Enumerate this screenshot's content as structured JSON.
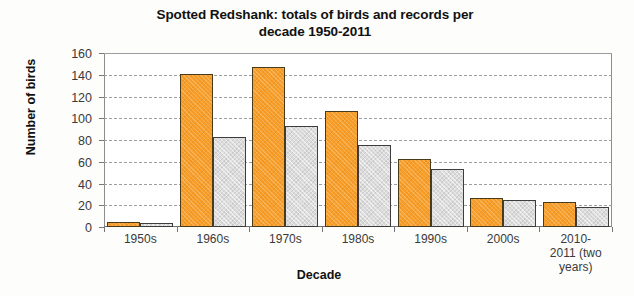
{
  "chart_data": {
    "type": "bar",
    "title": "Spotted Redshank: totals of birds and records per decade 1950-2011",
    "title_line1": "Spotted Redshank: totals of birds and records per",
    "title_line2": "decade 1950-2011",
    "xlabel": "Decade",
    "ylabel": "Number of birds",
    "ylim": [
      0,
      160
    ],
    "ytick_step": 20,
    "yticks": [
      160,
      140,
      120,
      100,
      80,
      60,
      40,
      20,
      0
    ],
    "grid": true,
    "legend": "none",
    "categories": [
      "1950s",
      "1960s",
      "1970s",
      "1980s",
      "1990s",
      "2000s",
      "2010-2011 (two years)"
    ],
    "category_lines": [
      [
        "1950s"
      ],
      [
        "1960s"
      ],
      [
        "1970s"
      ],
      [
        "1980s"
      ],
      [
        "1990s"
      ],
      [
        "2000s"
      ],
      [
        "2010-",
        "2011 (two",
        "years)"
      ]
    ],
    "series": [
      {
        "name": "birds",
        "color": "#f79d28",
        "values": [
          5,
          141,
          147,
          107,
          63,
          27,
          23
        ]
      },
      {
        "name": "records",
        "color": "#dcdcdc",
        "values": [
          4,
          83,
          93,
          75,
          53,
          25,
          18
        ]
      }
    ]
  },
  "colors": {
    "birds": "#f79d28",
    "records": "#dcdcdc",
    "axis": "#777777",
    "grid": "#9e9e9e",
    "text": "#1a1a1a",
    "background": "#fdfdfb"
  }
}
